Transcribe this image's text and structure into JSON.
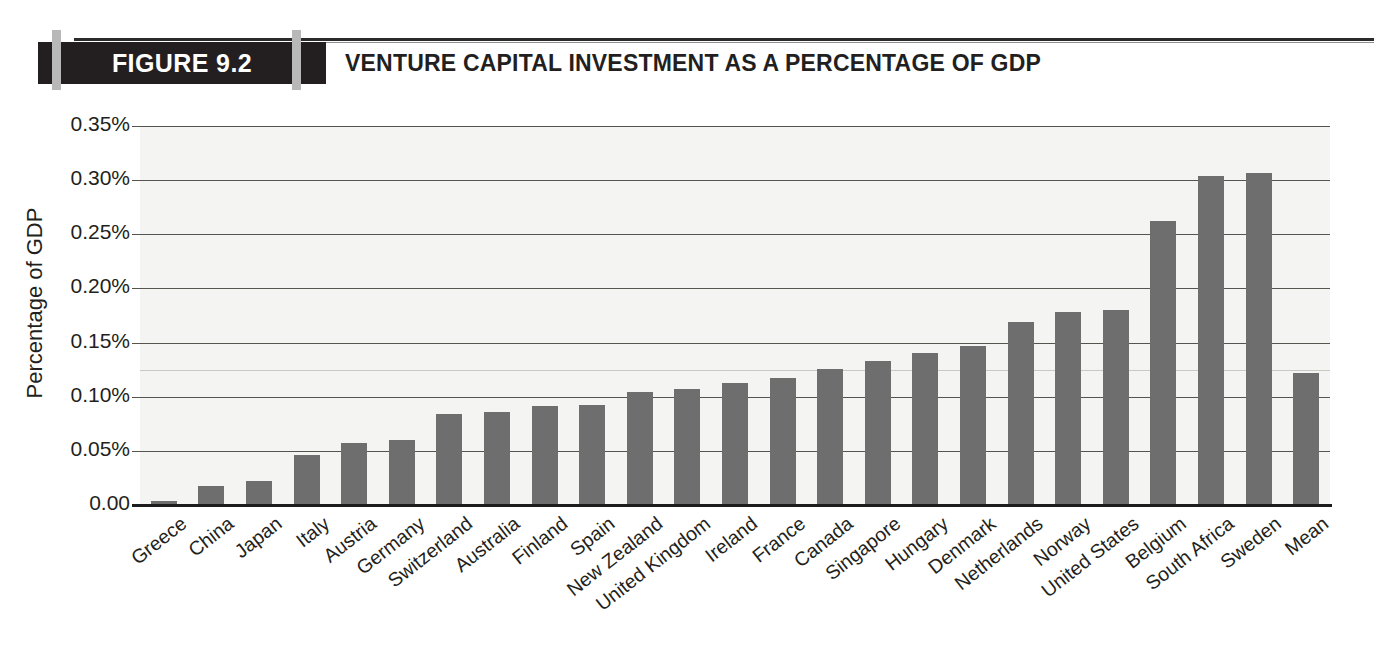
{
  "figure": {
    "number_label": "FIGURE 9.2",
    "title": "VENTURE CAPITAL INVESTMENT AS A PERCENTAGE OF GDP"
  },
  "colors": {
    "bar_fill": "#6e6e6e",
    "header_band": "#231f20",
    "header_tick": "#b8b8b8",
    "plot_background": "#f4f4f2",
    "gridline": "#55544f",
    "text": "#231f20"
  },
  "chart_data": {
    "type": "bar",
    "title": "VENTURE CAPITAL INVESTMENT AS A PERCENTAGE OF GDP",
    "xlabel": "",
    "ylabel": "Percentage of GDP",
    "ylim": [
      0,
      0.35
    ],
    "grid": true,
    "legend": null,
    "ytick_labels": [
      "0.35%",
      "0.30%",
      "0.25%",
      "0.20%",
      "0.15%",
      "0.10%",
      "0.05%",
      "0.00"
    ],
    "ytick_values": [
      0.35,
      0.3,
      0.25,
      0.2,
      0.15,
      0.1,
      0.05,
      0.0
    ],
    "categories": [
      "Greece",
      "China",
      "Japan",
      "Italy",
      "Austria",
      "Germany",
      "Switzerland",
      "Australia",
      "Finland",
      "Spain",
      "New Zealand",
      "United Kingdom",
      "Ireland",
      "France",
      "Canada",
      "Singapore",
      "Hungary",
      "Denmark",
      "Netherlands",
      "Norway",
      "United States",
      "Belgium",
      "South Africa",
      "Sweden",
      "Mean"
    ],
    "values": [
      0.004,
      0.018,
      0.022,
      0.046,
      0.057,
      0.06,
      0.084,
      0.086,
      0.091,
      0.092,
      0.104,
      0.107,
      0.113,
      0.117,
      0.126,
      0.133,
      0.14,
      0.147,
      0.169,
      0.178,
      0.18,
      0.262,
      0.304,
      0.307,
      0.122
    ],
    "value_unit": "%"
  }
}
